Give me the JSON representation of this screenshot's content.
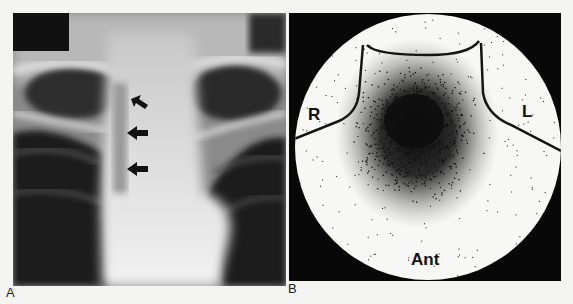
{
  "figure": {
    "panels": [
      {
        "id": "A",
        "label": "A",
        "type": "chest-radiograph",
        "annotations": {
          "arrows": [
            {
              "name": "arrow-1",
              "direction": "pointing-up-left"
            },
            {
              "name": "arrow-2",
              "direction": "pointing-left"
            },
            {
              "name": "arrow-3",
              "direction": "pointing-left"
            }
          ]
        }
      },
      {
        "id": "B",
        "label": "B",
        "type": "nuclear-scintigraphy-scan",
        "annotations": {
          "right_label": "R",
          "left_label": "L",
          "view_label": "Ant"
        }
      }
    ]
  },
  "colors": {
    "page_background": "#f4f4f2",
    "xray_dark": "#1a1a1a",
    "xray_bright": "#e8e8e8",
    "scan_background": "#080808",
    "scan_field": "#f7f7f5",
    "scan_dots": "#111111"
  }
}
